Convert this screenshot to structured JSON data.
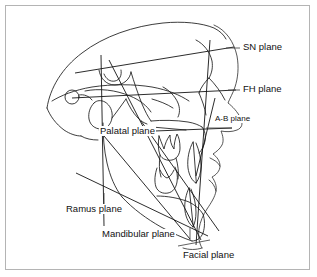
{
  "figure": {
    "kind": "cephalometric-tracing",
    "background_color": "#ffffff",
    "border_color": "#b4b4b4",
    "trace_color": "#1a1a1a",
    "label_color": "#111111",
    "width": 317,
    "height": 277
  },
  "labels": [
    {
      "id": "sn-plane",
      "text": "SN plane",
      "x": 243,
      "y": 42,
      "size": "normal"
    },
    {
      "id": "fh-plane",
      "text": "FH plane",
      "x": 243,
      "y": 84,
      "size": "normal"
    },
    {
      "id": "ab-plane",
      "text": "A-B plane",
      "x": 214,
      "y": 118,
      "size": "small"
    },
    {
      "id": "palatal-plane",
      "text": "Palatal plane",
      "x": 99,
      "y": 126,
      "size": "normal"
    },
    {
      "id": "ramus-plane",
      "text": "Ramus plane",
      "x": 65,
      "y": 204,
      "size": "normal"
    },
    {
      "id": "mandibular-plane",
      "text": "Mandibular plane",
      "x": 101,
      "y": 232,
      "size": "normal"
    },
    {
      "id": "facial-plane",
      "text": "Facial plane",
      "x": 182,
      "y": 252,
      "size": "normal"
    }
  ],
  "planes": [
    {
      "id": "sn-plane",
      "name": "SN plane",
      "note": "Sella-Nasion line, runs up to the right across the cranial base"
    },
    {
      "id": "fh-plane",
      "name": "FH plane",
      "note": "Frankfort horizontal, porion to orbitale, nearly horizontal"
    },
    {
      "id": "ab-plane",
      "name": "A-B plane",
      "note": "Point A to point B line"
    },
    {
      "id": "palatal-plane",
      "name": "Palatal plane",
      "note": "ANS to PNS line through the hard palate"
    },
    {
      "id": "ramus-plane",
      "name": "Ramus plane",
      "note": "Tangent along the posterior border of the mandibular ramus"
    },
    {
      "id": "mandibular-plane",
      "name": "Mandibular plane",
      "note": "Gonion to gnathion along the lower border of the mandible"
    },
    {
      "id": "facial-plane",
      "name": "Facial plane",
      "note": "Nasion to pogonion, steep near-vertical line to the chin"
    }
  ]
}
